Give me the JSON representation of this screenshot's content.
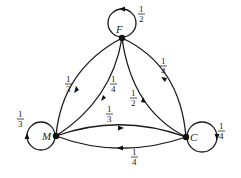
{
  "diagram": {
    "type": "markov-chain",
    "nodes": [
      {
        "id": "F",
        "label": "F",
        "self_loop": {
          "num": "1",
          "den": "2"
        }
      },
      {
        "id": "M",
        "label": "M",
        "self_loop": {
          "num": "1",
          "den": "3"
        }
      },
      {
        "id": "C",
        "label": "C",
        "self_loop": {
          "num": "1",
          "den": "4"
        }
      }
    ],
    "edges": [
      {
        "from": "M",
        "to": "F",
        "num": "1",
        "den": "3"
      },
      {
        "from": "F",
        "to": "M",
        "num": "1",
        "den": "4"
      },
      {
        "from": "C",
        "to": "F",
        "num": "1",
        "den": "2"
      },
      {
        "from": "F",
        "to": "C",
        "num": "1",
        "den": "4"
      },
      {
        "from": "M",
        "to": "C",
        "num": "1",
        "den": "3"
      },
      {
        "from": "C",
        "to": "M",
        "num": "1",
        "den": "4"
      }
    ]
  }
}
